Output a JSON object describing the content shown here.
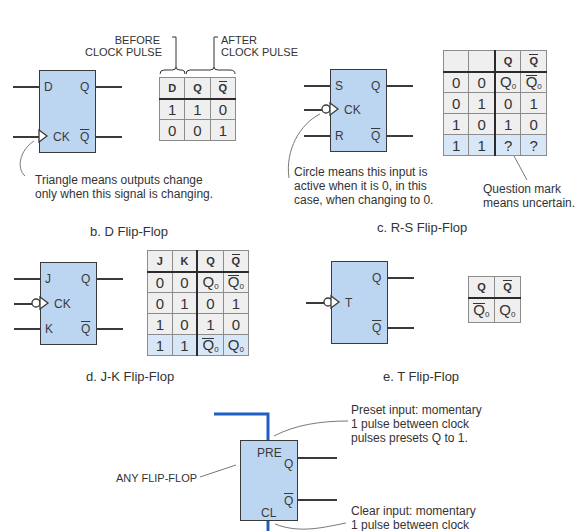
{
  "d_flipflop": {
    "caption": "b. D Flip-Flop",
    "pins": {
      "d": "D",
      "ck": "CK",
      "q": "Q",
      "qbar": "Q"
    },
    "before_label": "BEFORE\nCLOCK PULSE",
    "after_label": "AFTER\nCLOCK PULSE",
    "note": "Triangle means outputs change\nonly when this signal is changing.",
    "table": {
      "headers": [
        "D",
        "Q",
        "Q̄"
      ],
      "rows": [
        [
          "1",
          "1",
          "0"
        ],
        [
          "0",
          "0",
          "1"
        ]
      ]
    }
  },
  "rs_flipflop": {
    "caption": "c. R-S Flip-Flop",
    "pins": {
      "s": "S",
      "ck": "CK",
      "r": "R",
      "q": "Q",
      "qbar": "Q"
    },
    "note_circle": "Circle means this input is\nactive when it is 0, in this\ncase, when changing to 0.",
    "note_question": "Question mark\nmeans uncertain.",
    "table": {
      "headers": [
        "",
        "",
        "Q",
        "Q̄"
      ],
      "rows": [
        [
          "0",
          "0",
          "Q0",
          "Q̄0"
        ],
        [
          "0",
          "1",
          "0",
          "1"
        ],
        [
          "1",
          "0",
          "1",
          "0"
        ],
        [
          "1",
          "1",
          "?",
          "?"
        ]
      ]
    }
  },
  "jk_flipflop": {
    "caption": "d. J-K Flip-Flop",
    "pins": {
      "j": "J",
      "ck": "CK",
      "k": "K",
      "q": "Q",
      "qbar": "Q"
    },
    "table": {
      "headers": [
        "J",
        "K",
        "Q",
        "Q̄"
      ],
      "rows": [
        [
          "0",
          "0",
          "Q0",
          "Q̄0"
        ],
        [
          "0",
          "1",
          "0",
          "1"
        ],
        [
          "1",
          "0",
          "1",
          "0"
        ],
        [
          "1",
          "1",
          "Q̄0",
          "Q0"
        ]
      ]
    }
  },
  "t_flipflop": {
    "caption": "e. T Flip-Flop",
    "pins": {
      "t": "T",
      "q": "Q",
      "qbar": "Q"
    },
    "table": {
      "headers": [
        "Q",
        "Q̄"
      ],
      "rows": [
        [
          "Q̄0",
          "Q0"
        ]
      ]
    }
  },
  "any_flipflop": {
    "label": "ANY FLIP-FLOP",
    "pins": {
      "pre": "PRE",
      "q": "Q",
      "qbar": "Q",
      "cl": "CL"
    },
    "note_preset": "Preset input: momentary\n1 pulse between clock\npulses presets Q to 1.",
    "note_clear": "Clear input: momentary\n1 pulse between clock"
  },
  "colors": {
    "box_fill": "#bcd6f2",
    "highlight_row": "#d7e7f7",
    "table_fill": "#efefef",
    "preset_clear_wire": "#1f5fc4",
    "line": "#3a3a3a"
  }
}
